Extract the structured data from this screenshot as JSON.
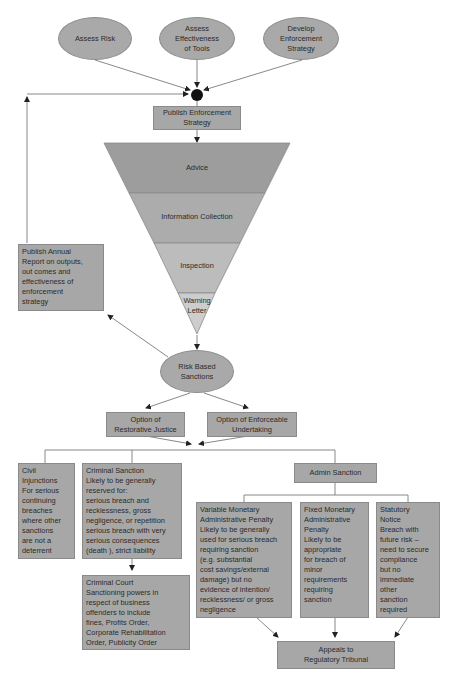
{
  "inputs": {
    "assess_risk": "Assess Risk",
    "assess_effectiveness": "Assess\nEffectiveness\nof Tools",
    "develop_strategy": "Develop\nEnforcement\nStrategy"
  },
  "publish_strategy": "Publish Enforcement\nStrategy",
  "funnel": {
    "levels": [
      {
        "label": "Advice",
        "color": "#9a9a9a"
      },
      {
        "label": "Information Collection",
        "color": "#a9a9a9"
      },
      {
        "label": "Inspection",
        "color": "#bdbdbd"
      },
      {
        "label": "Warning\nLetter",
        "color": "#cfcfcf"
      }
    ]
  },
  "annual_report": "Publish  Annual\nReport  on outputs,\nout comes and\neffectiveness    of\nenforcement\nstrategy",
  "risk_based_sanctions": "Risk Based\nSanctions",
  "options": {
    "restorative_justice": "Option  of\nRestorative Justice",
    "enforceable_undertaking": "Option  of  Enforceable\nUndertaking"
  },
  "civil_injunctions": "Civil\nInjunctions\nFor serious\ncontinuing\nbreaches\nwhere other\nsanctions\nare not a\ndeterrent",
  "criminal_sanction": "Criminal Sanction\nLikely to be generally\nreserved for:\nserious  breach and\nrecklessness, gross\nnegligence, or repetition\nserious  breach with very\nserious  consequences\n(death ), strict liability",
  "criminal_court": "Criminal Court\nSanctioning powers in\nrespect of business\noffenders to include\nfines, Profits Order,\nCorporate Rehabilitation\nOrder, Publicity Order",
  "admin_sanction": "Admin Sanction",
  "variable_penalty": "Variable Monetary\nAdministrative  Penalty\nLikely to be generally\nused for serious breach\nrequiring  sanction\n(e.g. substantial\ncost savings/external\ndamage) but no\nevidence of intention/\nrecklessness/ or gross\nnegligence",
  "fixed_penalty": "Fixed Monetary\nAdministrative\nPenalty\nLikely to be\nappropriate\nfor  breach of\nminor\nrequirements\nrequiring\nsanction",
  "statutory_notice": "Statutory\nNotice\nBreach with\nfuture risk –\nneed to  secure\ncompliance\nbut  no\nimmediate\nother\nsanction\nrequired",
  "appeals": "Appeals to\nRegulatory Tribunal",
  "colors": {
    "node_fill": "#a7a7a7",
    "line": "#777777",
    "junction": "#111111"
  }
}
